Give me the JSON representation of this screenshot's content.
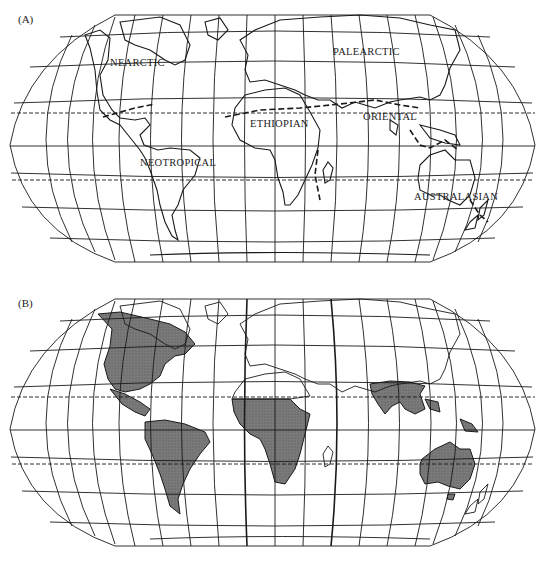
{
  "panels": [
    {
      "label": "(A)",
      "description": "Zoogeographic realms with boundaries",
      "realms": [
        {
          "name": "NEARCTIC",
          "x": 110,
          "y": 63
        },
        {
          "name": "PALEARCTIC",
          "x": 333,
          "y": 51
        },
        {
          "name": "ETHIOPIAN",
          "x": 250,
          "y": 123
        },
        {
          "name": "ORIENTAL",
          "x": 362,
          "y": 117
        },
        {
          "name": "NEOTROPICAL",
          "x": 140,
          "y": 162
        },
        {
          "name": "AUSTRALASIAN",
          "x": 414,
          "y": 196
        }
      ]
    },
    {
      "label": "(B)",
      "description": "Distribution map with shaded regions",
      "shaded_regions": [
        "North America",
        "Central America",
        "South America",
        "Sub-Saharan Africa",
        "Indian subcontinent and Southeast Asia",
        "New Guinea",
        "Australia",
        "Tasmania"
      ]
    }
  ],
  "colors": {
    "line": "#1a1a1a",
    "shade": "#6e6e6e",
    "background": "#ffffff"
  }
}
